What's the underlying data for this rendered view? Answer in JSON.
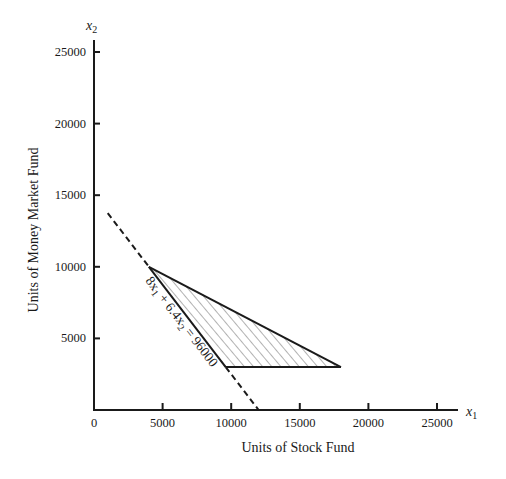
{
  "chart_data": {
    "type": "line",
    "title": "",
    "xlabel": "Units of Stock Fund",
    "ylabel": "Units of Money Market Fund",
    "x_var": "x",
    "x_var_sub": "1",
    "y_var": "x",
    "y_var_sub": "2",
    "xlim": [
      0,
      26000
    ],
    "ylim": [
      0,
      26000
    ],
    "x_ticks": [
      0,
      5000,
      10000,
      15000,
      20000,
      25000
    ],
    "y_ticks": [
      5000,
      10000,
      15000,
      20000,
      25000
    ],
    "x_tick_labels": [
      "0",
      "5000",
      "10000",
      "15000",
      "20000",
      "25000"
    ],
    "y_tick_labels": [
      "5000",
      "10000",
      "15000",
      "20000",
      "25000"
    ],
    "grid": false,
    "constraint_line": {
      "label": "8x1 + 6.4x2 = 96000",
      "label_parts": [
        "8x",
        "1",
        " + 6.4x",
        "2",
        " = 96000"
      ],
      "style": "dashed-extension-solid-boundary",
      "points": [
        [
          1000,
          13750
        ],
        [
          12000,
          0
        ]
      ]
    },
    "feasible_region": {
      "fill": "hatched",
      "vertices": [
        [
          4000,
          10000
        ],
        [
          18000,
          3000
        ],
        [
          9600,
          3000
        ]
      ]
    }
  }
}
